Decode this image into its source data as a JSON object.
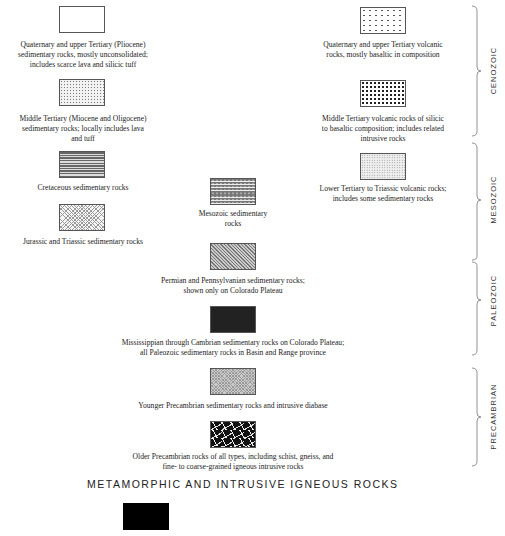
{
  "legend": {
    "units": [
      {
        "id": "qt-sed",
        "caption": "Quaternary and upper Tertiary (Pliocene)\nsedimentary rocks, mostly unconsolidated;\nincludes scarce lava and silicic tuff",
        "pattern": "blank",
        "era": "CENOZOIC"
      },
      {
        "id": "mt-sed",
        "caption": "Middle Tertiary (Miocene and Oligocene)\nsedimentary rocks; locally includes lava\nand tuff",
        "pattern": "stipple",
        "era": "CENOZOIC"
      },
      {
        "id": "qt-volc",
        "caption": "Quaternary and upper Tertiary volcanic\nrocks, mostly basaltic in composition",
        "pattern": "sparse-dots",
        "era": "CENOZOIC"
      },
      {
        "id": "mt-volc",
        "caption": "Middle Tertiary volcanic rocks of silicic\nto basaltic composition; includes related\nintrusive rocks",
        "pattern": "dense-dots",
        "era": "CENOZOIC"
      },
      {
        "id": "cret-sed",
        "caption": "Cretaceous sedimentary rocks",
        "pattern": "horizontal-lines",
        "era": "MESOZOIC"
      },
      {
        "id": "jt-sed",
        "caption": "Jurassic and Triassic sedimentary rocks",
        "pattern": "crosshatch",
        "era": "MESOZOIC"
      },
      {
        "id": "meso-sed",
        "caption": "Mesozoic sedimentary\nrocks",
        "pattern": "lined-dots",
        "era": "MESOZOIC"
      },
      {
        "id": "lt-volc",
        "caption": "Lower Tertiary to Triassic  volcanic rocks;\nincludes some sedimentary rocks",
        "pattern": "fine-stipple",
        "era": "MESOZOIC"
      },
      {
        "id": "pp-sed",
        "caption": "Permian and Pennsylvanian sedimentary rocks;\nshown only on Colorado Plateau",
        "pattern": "diagonal-lines",
        "era": "PALEOZOIC"
      },
      {
        "id": "mc-sed",
        "caption": "Mississippian through Cambrian sedimentary rocks on Colorado Plateau;\nall Paleozoic sedimentary rocks in Basin and Range province",
        "pattern": "dark",
        "era": "PALEOZOIC"
      },
      {
        "id": "yp-sed",
        "caption": "Younger Precambrian sedimentary rocks and intrusive diabase",
        "pattern": "fine-crosshatch",
        "era": "PRECAMBRIAN"
      },
      {
        "id": "op-rocks",
        "caption": "Older Precambrian rocks of all types, including schist, gneiss, and\nfine- to coarse-grained igneous intrusive rocks",
        "pattern": "black-with-dashes",
        "era": "PRECAMBRIAN"
      }
    ],
    "eras": [
      "CENOZOIC",
      "MESOZOIC",
      "PALEOZOIC",
      "PRECAMBRIAN"
    ],
    "section_heading": "METAMORPHIC AND INTRUSIVE IGNEOUS ROCKS",
    "metamorphic_unit": {
      "pattern": "solid-black"
    }
  }
}
